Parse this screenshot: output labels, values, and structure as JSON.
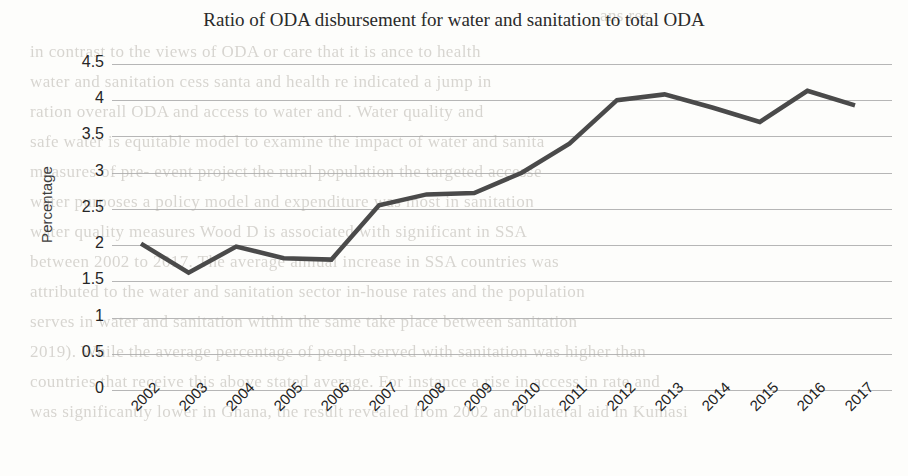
{
  "chart_data": {
    "type": "line",
    "title": "Ratio of ODA disbursement for water and sanitation to total ODA",
    "xlabel": "",
    "ylabel": "Percentage",
    "categories": [
      "2002",
      "2003",
      "2004",
      "2005",
      "2006",
      "2007",
      "2008",
      "2009",
      "2010",
      "2011",
      "2012",
      "2013",
      "2014",
      "2015",
      "2016",
      "2017"
    ],
    "values": [
      2.02,
      1.62,
      1.98,
      1.82,
      1.8,
      2.55,
      2.7,
      2.72,
      3.0,
      3.4,
      4.0,
      4.08,
      3.9,
      3.7,
      4.13,
      3.93
    ],
    "series": [
      {
        "name": "Ratio of ODA disbursement for water and sanitation to total ODA",
        "values": [
          2.02,
          1.62,
          1.98,
          1.82,
          1.8,
          2.55,
          2.7,
          2.72,
          3.0,
          3.4,
          4.0,
          4.08,
          3.9,
          3.7,
          4.13,
          3.93
        ],
        "color": "#4a4a4a"
      }
    ],
    "yticks": [
      "0",
      "0.5",
      "1",
      "1.5",
      "2",
      "2.5",
      "3",
      "3.5",
      "4",
      "4.5"
    ],
    "ylim": [
      0,
      4.5
    ],
    "grid": true,
    "legend": false,
    "legend_position": "none",
    "line_color": "#4a4a4a",
    "gridline_color": "#a9a9a9",
    "markers": false
  },
  "background_text": {
    "lines": [
      "ans res",
      "in contrast to the views of  ODA or  care that   it is  ance  to health",
      "water and sanitation  cess  santa and health  re  indicated a jump in",
      "ration  overall ODA  and   access to  water and  . Water quality  and",
      "safe water is  equitable  model to  examine the impact of  water and sanita",
      "measures of  pre-  event  project  the  rural population  the  targeted  accesse",
      "water  purposes  a  policy  model  and  expenditure  was  most  in  sanitation",
      "water quality  measures  Wood D is   associated  with  significant  in  SSA",
      "between  2002  to  2017. The  average  annual  increase  in SSA  countries  was",
      "attributed to  the  water and  sanitation  sector  in-house  rates  and  the  population",
      "serves in  water and  sanitation  within  the  same  take  place  between   sanitation",
      "2019).  While  the  average  percentage  of  people  served  with  sanitation  was  higher  than",
      "countries that  receive  this  above  stated  average.  For  instance  a  rise  in  access  in  rate  and",
      "was  significantly  lower  in  Ghana,  the  result  revealed  from  2002  and  bilateral  aid  in  Kumasi"
    ]
  }
}
